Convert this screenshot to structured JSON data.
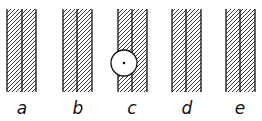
{
  "diagram": {
    "panels": [
      {
        "label": "a",
        "x": 7,
        "has_circle": false
      },
      {
        "label": "b",
        "x": 63,
        "has_circle": false
      },
      {
        "label": "c",
        "x": 118,
        "has_circle": true
      },
      {
        "label": "d",
        "x": 172,
        "has_circle": false
      },
      {
        "label": "e",
        "x": 226,
        "has_circle": false
      }
    ],
    "colors": {
      "line": "#111111",
      "background": "#ffffff"
    }
  }
}
